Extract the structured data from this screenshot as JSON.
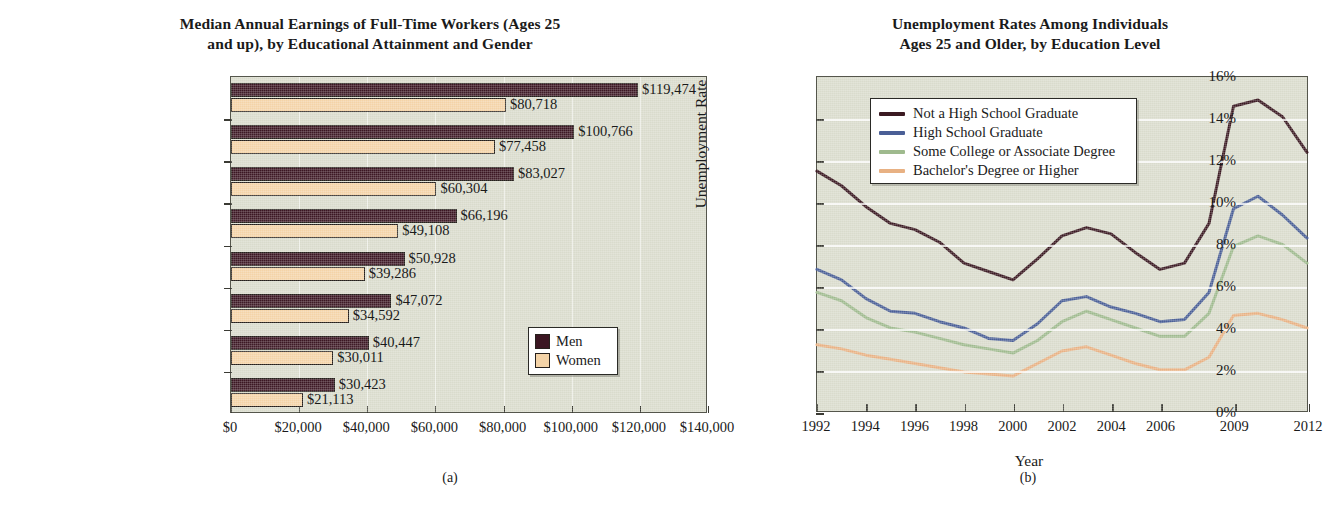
{
  "figure": {
    "panel_a_letter": "(a)",
    "panel_b_letter": "(b)"
  },
  "bar_panel": {
    "title_line1": "Median Annual Earnings of Full-Time Workers (Ages 25",
    "title_line2": "and up), by Educational Attainment and Gender",
    "legend": {
      "men": "Men",
      "women": "Women"
    },
    "colors": {
      "men": "#3b1622",
      "women": "#f4d3a7",
      "plot_bg": "#d9dbcc"
    }
  },
  "line_panel": {
    "title_line1": "Unemployment Rates Among Individuals",
    "title_line2": "Ages 25 and Older, by Education Level",
    "y_axis_title": "Unemployment Rate",
    "x_axis_title": "Year",
    "colors": {
      "not_hs": "#3b1a22",
      "hs_grad": "#4a5f96",
      "some_college": "#9fba8e",
      "bachelor": "#e8b183",
      "plot_bg": "#d9dbcc"
    }
  },
  "chart_data": [
    {
      "type": "bar",
      "orientation": "horizontal",
      "title": "Median Annual Earnings of Full-Time Workers (Ages 25 and up), by Educational Attainment and Gender",
      "xlabel": "",
      "ylabel": "",
      "xlim": [
        0,
        140000
      ],
      "xticks": [
        "$0",
        "$20,000",
        "$40,000",
        "$60,000",
        "$80,000",
        "$100,000",
        "$120,000",
        "$140,000"
      ],
      "xtick_values": [
        0,
        20000,
        40000,
        60000,
        80000,
        100000,
        120000,
        140000
      ],
      "grid": true,
      "legend_position": "inside-right",
      "categories": [
        "Professional degree",
        "Doctoral Degree",
        "Master's Degree",
        "Bachelor's Degree",
        "Associate Degree",
        "Some College, No Degree",
        "High School Graduate",
        "Not a High School Graduate"
      ],
      "series": [
        {
          "name": "Men",
          "color": "#3b1622",
          "values": [
            119474,
            100766,
            83027,
            66196,
            50928,
            47072,
            40447,
            30423
          ],
          "labels": [
            "$119,474",
            "$100,766",
            "$83,027",
            "$66,196",
            "$50,928",
            "$47,072",
            "$40,447",
            "$30,423"
          ]
        },
        {
          "name": "Women",
          "color": "#f4d3a7",
          "values": [
            80718,
            77458,
            60304,
            49108,
            39286,
            34592,
            30011,
            21113
          ],
          "labels": [
            "$80,718",
            "$77,458",
            "$60,304",
            "$49,108",
            "$39,286",
            "$34,592",
            "$30,011",
            "$21,113"
          ]
        }
      ]
    },
    {
      "type": "line",
      "title": "Unemployment Rates Among Individuals Ages 25 and Older, by Education Level",
      "xlabel": "Year",
      "ylabel": "Unemployment Rate",
      "ylim": [
        0,
        16
      ],
      "yticks": [
        "0%",
        "2%",
        "4%",
        "6%",
        "8%",
        "10%",
        "12%",
        "14%",
        "16%"
      ],
      "ytick_values": [
        0,
        2,
        4,
        6,
        8,
        10,
        12,
        14,
        16
      ],
      "xticks": [
        "1992",
        "1994",
        "1996",
        "1998",
        "2000",
        "2002",
        "2004",
        "2006",
        "2009",
        "2012"
      ],
      "x": [
        1992,
        1993,
        1994,
        1995,
        1996,
        1997,
        1998,
        1999,
        2000,
        2001,
        2002,
        2003,
        2004,
        2005,
        2006,
        2007,
        2008,
        2009,
        2010,
        2011,
        2012
      ],
      "grid": true,
      "legend_position": "upper-left-inside",
      "series": [
        {
          "name": "Not a High School Graduate",
          "color": "#3b1a22",
          "values": [
            11.5,
            10.8,
            9.8,
            9.0,
            8.7,
            8.1,
            7.1,
            6.7,
            6.3,
            7.3,
            8.4,
            8.8,
            8.5,
            7.6,
            6.8,
            7.1,
            9.0,
            14.6,
            14.9,
            14.1,
            12.4
          ]
        },
        {
          "name": "High School Graduate",
          "color": "#4a5f96",
          "values": [
            6.8,
            6.3,
            5.4,
            4.8,
            4.7,
            4.3,
            4.0,
            3.5,
            3.4,
            4.2,
            5.3,
            5.5,
            5.0,
            4.7,
            4.3,
            4.4,
            5.7,
            9.7,
            10.3,
            9.4,
            8.3
          ]
        },
        {
          "name": "Some College or Associate Degree",
          "color": "#9fba8e",
          "values": [
            5.7,
            5.3,
            4.5,
            4.0,
            3.8,
            3.5,
            3.2,
            3.0,
            2.8,
            3.4,
            4.3,
            4.8,
            4.4,
            4.0,
            3.6,
            3.6,
            4.7,
            7.9,
            8.4,
            8.0,
            7.1
          ]
        },
        {
          "name": "Bachelor's Degree or Higher",
          "color": "#e8b183",
          "values": [
            3.2,
            3.0,
            2.7,
            2.5,
            2.3,
            2.1,
            1.9,
            1.8,
            1.7,
            2.3,
            2.9,
            3.1,
            2.7,
            2.3,
            2.0,
            2.0,
            2.6,
            4.6,
            4.7,
            4.4,
            4.0
          ]
        }
      ]
    }
  ]
}
